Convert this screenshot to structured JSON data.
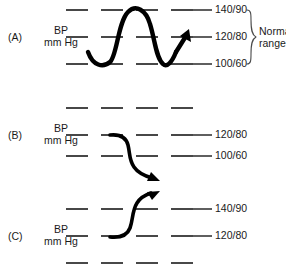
{
  "figure": {
    "title_visible": false,
    "panels": [
      {
        "id": "A",
        "letter": "(A)",
        "axis_label_line1": "BP",
        "axis_label_line2": "mm Hg",
        "rows": [
          {
            "label": "140/90",
            "y": 10
          },
          {
            "label": "120/80",
            "y": 37
          },
          {
            "label": "100/60",
            "y": 64
          }
        ],
        "annotation": {
          "line1": "Norma",
          "line2": "range"
        },
        "trace_type": "oscillating-wave-with-up-arrow"
      },
      {
        "id": "B",
        "letter": "(B)",
        "axis_label_line1": "BP",
        "axis_label_line2": "mm Hg",
        "rows": [
          {
            "label": "",
            "y": 13
          },
          {
            "label": "120/80",
            "y": 40
          },
          {
            "label": "100/60",
            "y": 61
          }
        ],
        "trace_type": "falling-curve-with-down-arrow"
      },
      {
        "id": "C",
        "letter": "(C)",
        "axis_label_line1": "BP",
        "axis_label_line2": "mm Hg",
        "rows": [
          {
            "label": "140/90",
            "y": 22
          },
          {
            "label": "120/80",
            "y": 49
          },
          {
            "label": "",
            "y": 76
          }
        ],
        "trace_type": "rising-curve-with-up-arrow"
      }
    ],
    "colors": {
      "ink": "#1a1a1a",
      "trace": "#000000",
      "brace": "#4a4a4a",
      "background": "#ffffff"
    }
  }
}
